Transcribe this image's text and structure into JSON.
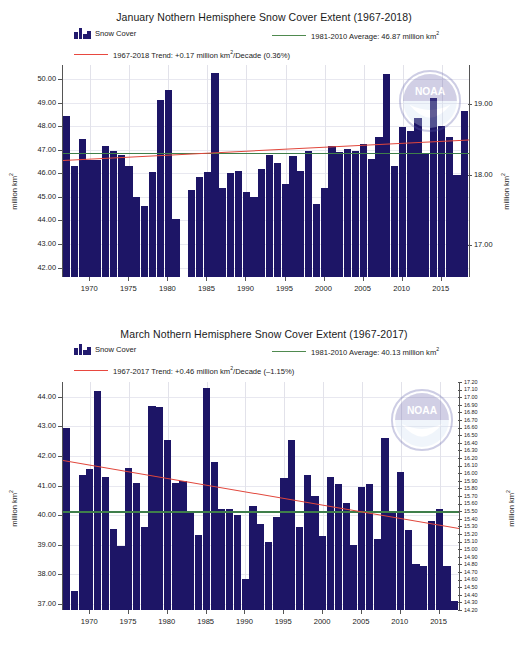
{
  "charts": [
    {
      "title": "January Nothern Hemisphere Snow Cover Extent (1967-2018)",
      "legend": {
        "bars_label": "Snow Cover",
        "average_label": "1981-2010 Average: 46.87 million km",
        "average_sup": "2",
        "trend_label_a": "1967-2018 Trend: +0.17 million km",
        "trend_sup": "2",
        "trend_label_b": "/Decade (0.36%)"
      },
      "ylabel_left": "million km",
      "ylabel_left_sup": "2",
      "ylabel_right": "million km",
      "ylabel_right_sup": "2",
      "chart_data": {
        "type": "bar",
        "title": "January Nothern Hemisphere Snow Cover Extent (1967-2018)",
        "xlabel": "",
        "ylabel": "million km2",
        "ylim": [
          41.6,
          50.6
        ],
        "y2lim": [
          16.55,
          19.55
        ],
        "grid": true,
        "legend_position": "top",
        "yticks": [
          "50.00",
          "49.00",
          "48.00",
          "47.00",
          "46.00",
          "45.00",
          "44.00",
          "43.00",
          "42.00"
        ],
        "y2ticks": [
          "19.00",
          "18.00",
          "17.00"
        ],
        "xticks": [
          1970,
          1975,
          1980,
          1985,
          1990,
          1995,
          2000,
          2005,
          2010,
          2015
        ],
        "average_value": 46.87,
        "trend_per_decade": 0.17,
        "trend_percent": 0.36,
        "trend_start": 46.55,
        "trend_end": 47.42,
        "x": [
          1967,
          1968,
          1969,
          1970,
          1971,
          1972,
          1973,
          1974,
          1975,
          1976,
          1977,
          1978,
          1979,
          1980,
          1981,
          1982,
          1983,
          1984,
          1985,
          1986,
          1987,
          1988,
          1989,
          1990,
          1991,
          1992,
          1993,
          1994,
          1995,
          1996,
          1997,
          1998,
          1999,
          2000,
          2001,
          2002,
          2003,
          2004,
          2005,
          2006,
          2007,
          2008,
          2009,
          2010,
          2011,
          2012,
          2013,
          2014,
          2015,
          2016,
          2017,
          2018
        ],
        "values": [
          48.45,
          46.3,
          47.48,
          46.55,
          46.55,
          47.18,
          46.95,
          46.8,
          46.3,
          45.0,
          44.6,
          46.05,
          49.1,
          49.55,
          44.05,
          41.6,
          45.3,
          45.85,
          46.05,
          50.25,
          45.4,
          46.0,
          46.1,
          45.2,
          45.0,
          46.2,
          46.8,
          46.45,
          45.55,
          46.75,
          46.1,
          46.95,
          44.7,
          45.4,
          47.15,
          46.9,
          47.05,
          46.95,
          47.25,
          46.6,
          47.55,
          50.2,
          46.3,
          47.95,
          47.8,
          48.35,
          46.85,
          49.2,
          48.0,
          47.55,
          45.95,
          48.65
        ]
      }
    },
    {
      "title": "March Nothern Hemisphere Snow Cover Extent (1967-2017)",
      "legend": {
        "bars_label": "Snow Cover",
        "average_label": "1981-2010 Average: 40.13 million km",
        "average_sup": "2",
        "trend_label_a": "1967-2017 Trend: +0.46 million km",
        "trend_sup": "2",
        "trend_label_b": "/Decade (–1.15%)"
      },
      "ylabel_left": "million km",
      "ylabel_left_sup": "2",
      "ylabel_right": "million km",
      "ylabel_right_sup": "2",
      "chart_data": {
        "type": "bar",
        "title": "March Nothern Hemisphere Snow Cover Extent (1967-2017)",
        "xlabel": "",
        "ylabel": "million km2",
        "ylim": [
          36.8,
          44.5
        ],
        "y2lim": [
          14.2,
          17.2
        ],
        "grid": true,
        "legend_position": "top",
        "yticks": [
          "44.00",
          "43.00",
          "42.00",
          "41.00",
          "40.00",
          "39.00",
          "38.00",
          "37.00"
        ],
        "y2ticks": [
          "17.20",
          "17.10",
          "17.00",
          "16.90",
          "16.80",
          "16.70",
          "16.60",
          "16.50",
          "16.40",
          "16.30",
          "16.20",
          "16.10",
          "16.00",
          "15.90",
          "15.80",
          "15.70",
          "15.60",
          "15.50",
          "15.40",
          "15.30",
          "15.20",
          "15.10",
          "15.00",
          "14.90",
          "14.80",
          "14.70",
          "14.60",
          "14.50",
          "14.40",
          "14.30",
          "14.20"
        ],
        "xticks": [
          1970,
          1975,
          1980,
          1985,
          1990,
          1995,
          2000,
          2005,
          2010,
          2015
        ],
        "average_value": 40.13,
        "trend_per_decade": -0.46,
        "trend_percent": -1.15,
        "trend_start": 41.85,
        "trend_end": 39.55,
        "x": [
          1967,
          1968,
          1969,
          1970,
          1971,
          1972,
          1973,
          1974,
          1975,
          1976,
          1977,
          1978,
          1979,
          1980,
          1981,
          1982,
          1983,
          1984,
          1985,
          1986,
          1987,
          1988,
          1989,
          1990,
          1991,
          1992,
          1993,
          1994,
          1995,
          1996,
          1997,
          1998,
          1999,
          2000,
          2001,
          2002,
          2003,
          2004,
          2005,
          2006,
          2007,
          2008,
          2009,
          2010,
          2011,
          2012,
          2013,
          2014,
          2015,
          2016,
          2017
        ],
        "values": [
          42.95,
          37.45,
          41.35,
          41.55,
          44.2,
          41.3,
          39.55,
          38.95,
          41.6,
          41.1,
          39.6,
          43.7,
          43.65,
          42.55,
          41.1,
          41.15,
          40.1,
          39.35,
          44.3,
          41.8,
          40.2,
          40.2,
          40.0,
          37.85,
          40.3,
          39.7,
          39.1,
          39.95,
          41.25,
          42.55,
          39.6,
          41.35,
          40.65,
          39.3,
          41.3,
          41.05,
          40.4,
          39.0,
          40.95,
          41.05,
          39.2,
          42.6,
          40.1,
          41.45,
          39.5,
          38.35,
          38.3,
          39.8,
          40.2,
          38.3,
          37.1
        ]
      }
    }
  ],
  "watermark": {
    "name": "noaa-logo",
    "text": "NOAA"
  }
}
